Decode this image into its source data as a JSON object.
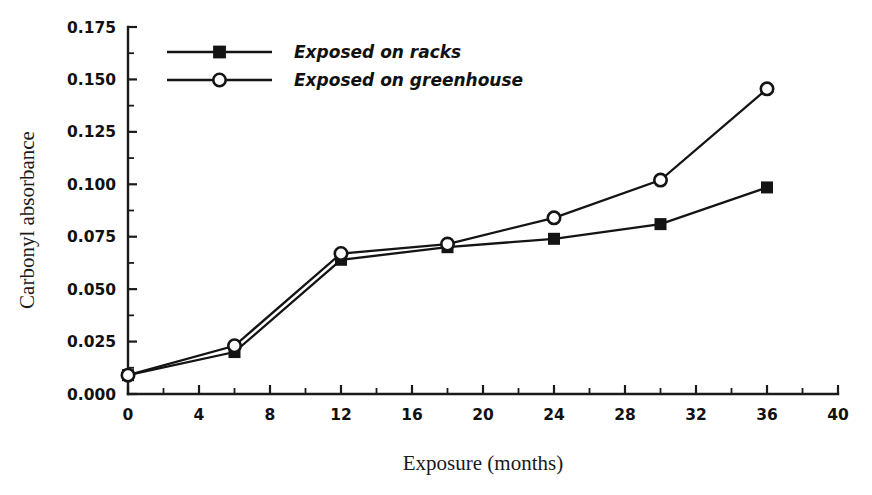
{
  "chart_data": {
    "type": "line",
    "title": "",
    "xlabel": "Exposure (months)",
    "ylabel": "Carbonyl absorbance",
    "xlim": [
      0,
      40
    ],
    "ylim": [
      0.0,
      0.175
    ],
    "grid": false,
    "legend_position": "top-left inside plot",
    "x_ticks": [
      0,
      4,
      8,
      12,
      16,
      20,
      24,
      28,
      32,
      36,
      40
    ],
    "x_tick_labels": [
      "0",
      "4",
      "8",
      "12",
      "16",
      "20",
      "24",
      "28",
      "32",
      "36",
      "40"
    ],
    "x_minor_ticks": [
      2,
      6,
      10,
      14,
      18,
      22,
      26,
      30,
      34,
      38
    ],
    "y_ticks": [
      0.0,
      0.025,
      0.05,
      0.075,
      0.1,
      0.125,
      0.15,
      0.175
    ],
    "y_tick_labels": [
      "0.000",
      "0.025",
      "0.050",
      "0.075",
      "0.100",
      "0.125",
      "0.150",
      "0.175"
    ],
    "y_minor_ticks": [
      0.0125,
      0.0375,
      0.0625,
      0.0875,
      0.1125,
      0.1375,
      0.1625
    ],
    "x": [
      0,
      6,
      12,
      18,
      24,
      30,
      36
    ],
    "series": [
      {
        "name": "Exposed on racks",
        "marker": "filled-square",
        "values": [
          0.009,
          0.02,
          0.064,
          0.07,
          0.074,
          0.081,
          0.0985
        ]
      },
      {
        "name": "Exposed on greenhouse",
        "marker": "open-circle",
        "values": [
          0.009,
          0.023,
          0.067,
          0.0715,
          0.084,
          0.102,
          0.1455
        ]
      }
    ]
  },
  "legend": {
    "entries": [
      {
        "label": "Exposed on racks",
        "marker": "filled-square-icon"
      },
      {
        "label": "Exposed on greenhouse",
        "marker": "open-circle-icon"
      }
    ]
  },
  "colors": {
    "ink": "#141414",
    "background": "#ffffff"
  }
}
